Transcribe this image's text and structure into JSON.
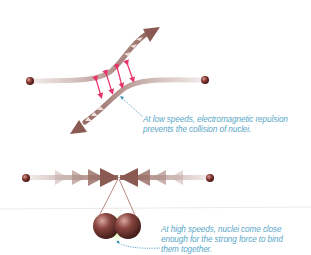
{
  "diagram": {
    "scenario_low_speed": {
      "caption_lines": [
        "At low speeds, electromagnetic repulsion",
        "prevents the collision of nuclei."
      ],
      "elements": [
        "left-nucleus",
        "right-nucleus",
        "deflected-path-up",
        "deflected-path-down",
        "repulsion-arrows"
      ]
    },
    "scenario_high_speed": {
      "caption_lines": [
        "At high speeds, nuclei come close",
        "enough for the strong force to bind",
        "them together."
      ],
      "elements": [
        "left-nucleus",
        "right-nucleus",
        "converging-arrows",
        "fused-nuclei-zoom"
      ]
    },
    "colors": {
      "path": "#8a5a52",
      "nucleus": "#7a2e2a",
      "repulsion": "#e8336a",
      "caption": "#5aa8c9",
      "strong_force_glow": "#9fd86a",
      "pointer": "#3a8fb8"
    }
  }
}
